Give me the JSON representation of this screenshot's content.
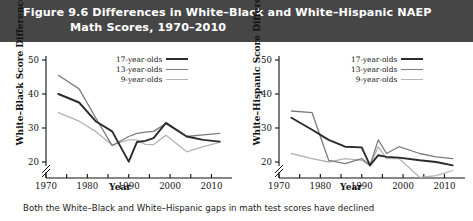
{
  "title": {
    "line1": "Figure 9.6  Differences in White–Black and White–Hispanic NAEP",
    "line2": "Math Scores, 1970–2010",
    "background": "#464646",
    "text_color": "#ffffff"
  },
  "caption": "Both the White–Black and White–Hispanic gaps in math test scores have declined",
  "legend": {
    "items": [
      {
        "label": "17-year-olds",
        "color": "#2b2b2b"
      },
      {
        "label": "13-year-olds",
        "color": "#7c7c7c"
      },
      {
        "label": "9-year-olds",
        "color": "#b4b4b4"
      }
    ]
  },
  "chart_data": [
    {
      "id": "white-black",
      "type": "line",
      "title": "White–Black NAEP Math Score Difference",
      "xlabel": "Year",
      "ylabel": "White–Black Score Difference",
      "xlim": [
        1970,
        2014
      ],
      "ylim": [
        15,
        50
      ],
      "yticks": [
        20,
        30,
        40,
        50
      ],
      "xticks": [
        1970,
        1975,
        1980,
        1985,
        1990,
        1995,
        2000,
        2005,
        2010
      ],
      "xtick_labels": [
        "1970",
        "",
        "1980",
        "",
        "1990",
        "",
        "2000",
        "",
        "2010"
      ],
      "axis_break": true,
      "grid": false,
      "legend_position": "top-right",
      "series": [
        {
          "name": "17-year-olds",
          "color": "#2b2b2b",
          "x": [
            1973,
            1978,
            1982,
            1986,
            1990,
            1992,
            1994,
            1996,
            1999,
            2004,
            2008,
            2012
          ],
          "y": [
            40.0,
            37.5,
            32.0,
            29.0,
            20.1,
            25.9,
            26.2,
            27.0,
            31.5,
            27.5,
            26.5,
            26.0
          ]
        },
        {
          "name": "13-year-olds",
          "color": "#7c7c7c",
          "x": [
            1973,
            1978,
            1982,
            1986,
            1990,
            1992,
            1994,
            1996,
            1999,
            2004,
            2008,
            2012
          ],
          "y": [
            45.5,
            41.5,
            33.0,
            24.8,
            27.5,
            28.4,
            28.8,
            29.0,
            31.3,
            27.5,
            28.0,
            28.4
          ]
        },
        {
          "name": "9-year-olds",
          "color": "#b4b4b4",
          "x": [
            1973,
            1978,
            1982,
            1986,
            1990,
            1992,
            1994,
            1996,
            1999,
            2004,
            2008,
            2012
          ],
          "y": [
            34.5,
            32.0,
            29.0,
            25.0,
            26.5,
            26.5,
            25.2,
            25.1,
            27.9,
            23.0,
            24.5,
            25.8
          ]
        }
      ]
    },
    {
      "id": "white-hispanic",
      "type": "line",
      "title": "White–Hispanic NAEP Math Score Difference",
      "xlabel": "Year",
      "ylabel": "White–Hispanic Score Difference",
      "xlim": [
        1970,
        2014
      ],
      "ylim": [
        15,
        50
      ],
      "yticks": [
        20,
        30,
        40,
        50
      ],
      "xticks": [
        1970,
        1975,
        1980,
        1985,
        1990,
        1995,
        2000,
        2005,
        2010
      ],
      "xtick_labels": [
        "1970",
        "",
        "1980",
        "",
        "1990",
        "",
        "2000",
        "",
        "2010"
      ],
      "axis_break": true,
      "grid": false,
      "legend_position": "top-right",
      "series": [
        {
          "name": "17-year-olds",
          "color": "#2b2b2b",
          "x": [
            1973,
            1978,
            1982,
            1986,
            1990,
            1992,
            1994,
            1996,
            1999,
            2004,
            2008,
            2012
          ],
          "y": [
            33.0,
            29.5,
            26.5,
            24.5,
            24.3,
            19.0,
            22.0,
            21.5,
            21.3,
            20.5,
            20.0,
            19.0
          ]
        },
        {
          "name": "13-year-olds",
          "color": "#7c7c7c",
          "x": [
            1973,
            1978,
            1982,
            1986,
            1990,
            1992,
            1994,
            1996,
            1999,
            2004,
            2008,
            2012
          ],
          "y": [
            35.0,
            34.5,
            20.5,
            19.5,
            21.0,
            19.0,
            26.5,
            22.5,
            24.5,
            22.5,
            21.5,
            21.0
          ]
        },
        {
          "name": "9-year-olds",
          "color": "#b4b4b4",
          "x": [
            1973,
            1978,
            1982,
            1986,
            1990,
            1992,
            1994,
            1996,
            1999,
            2004,
            2008,
            2012
          ],
          "y": [
            22.5,
            21.0,
            20.0,
            21.0,
            20.5,
            19.0,
            24.5,
            21.0,
            21.0,
            15.5,
            16.0,
            17.5
          ]
        }
      ]
    }
  ]
}
